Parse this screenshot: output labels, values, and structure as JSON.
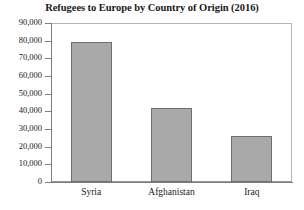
{
  "chart_data": {
    "type": "bar",
    "title": "Refugees to Europe by Country of Origin (2016)",
    "xlabel": "",
    "ylabel": "",
    "categories": [
      "Syria",
      "Afghanistan",
      "Iraq"
    ],
    "values": [
      79000,
      42000,
      26000
    ],
    "ylim": [
      0,
      90000
    ],
    "ytick_values": [
      0,
      10000,
      20000,
      30000,
      40000,
      50000,
      60000,
      70000,
      80000,
      90000
    ],
    "ytick_labels": [
      "0",
      "10,000",
      "20,000",
      "30,000",
      "40,000",
      "50,000",
      "60,000",
      "70,000",
      "80,000",
      "90,000"
    ],
    "grid": false,
    "legend": false,
    "legend_position": "none",
    "bar_fill_color": "#a9a9a9",
    "bar_edge_color": "#6f6f6f",
    "axis_color": "#7d7d7d",
    "frame_color": "#b5b5b5",
    "background_color": "#ffffff",
    "text_color": "#1a1a1a"
  }
}
